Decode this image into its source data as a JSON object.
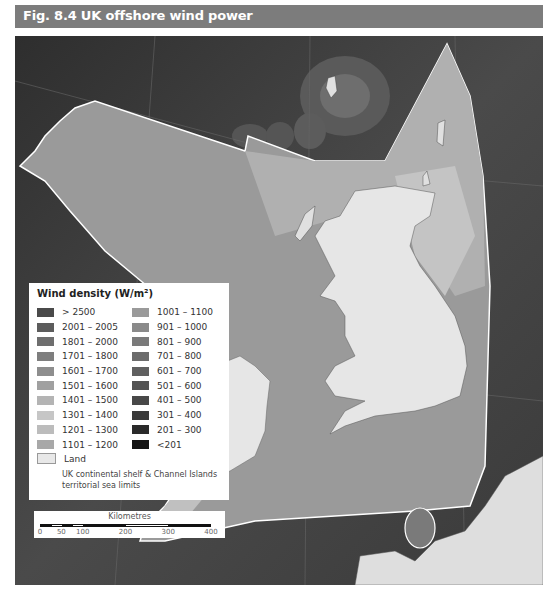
{
  "header": {
    "title": "Fig. 8.4 UK offshore wind power"
  },
  "legend": {
    "title": "Wind density (W/m²)",
    "left_column": [
      {
        "label": "> 2500",
        "color": "#4a4a4a"
      },
      {
        "label": "2001 – 2005",
        "color": "#5c5c5c"
      },
      {
        "label": "1801 – 2000",
        "color": "#6e6e6e"
      },
      {
        "label": "1701 – 1800",
        "color": "#7e7e7e"
      },
      {
        "label": "1601 – 1700",
        "color": "#8e8e8e"
      },
      {
        "label": "1501 – 1600",
        "color": "#a0a0a0"
      },
      {
        "label": "1401 – 1500",
        "color": "#b4b4b4"
      },
      {
        "label": "1301 – 1400",
        "color": "#c6c6c6"
      },
      {
        "label": "1201 – 1300",
        "color": "#bcbcbc"
      },
      {
        "label": "1101 – 1200",
        "color": "#a8a8a8"
      }
    ],
    "right_column": [
      {
        "label": "1001 – 1100",
        "color": "#9a9a9a"
      },
      {
        "label": "901 – 1000",
        "color": "#8a8a8a"
      },
      {
        "label": "801 – 900",
        "color": "#7a7a7a"
      },
      {
        "label": "701 – 800",
        "color": "#6c6c6c"
      },
      {
        "label": "601 – 700",
        "color": "#606060"
      },
      {
        "label": "501 – 600",
        "color": "#545454"
      },
      {
        "label": "401 – 500",
        "color": "#484848"
      },
      {
        "label": "301 – 400",
        "color": "#3a3a3a"
      },
      {
        "label": "201 – 300",
        "color": "#2a2a2a"
      },
      {
        "label": "<201",
        "color": "#141414"
      }
    ],
    "land_label": "Land",
    "limits_label": "UK continental shelf & Channel Islands territorial sea limits"
  },
  "scale": {
    "title": "Kilometres",
    "ticks": [
      "0",
      "50",
      "100",
      "200",
      "300",
      "400"
    ]
  }
}
